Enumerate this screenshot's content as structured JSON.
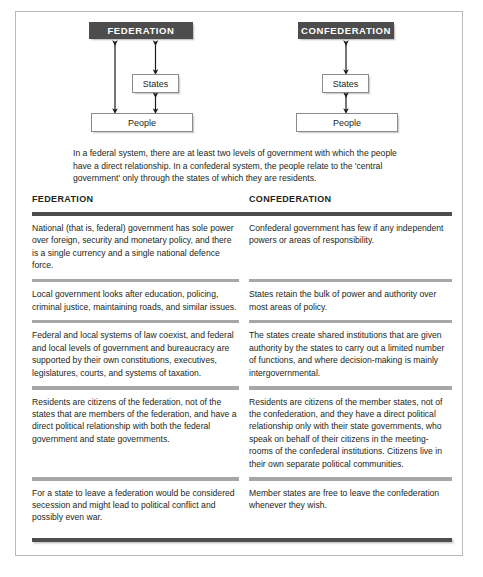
{
  "diagram": {
    "federation": {
      "title": "FEDERATION",
      "states": "States",
      "people": "People"
    },
    "confederation": {
      "title": "CONFEDERATION",
      "states": "States",
      "people": "People"
    },
    "caption": "In a federal system, there are at least two levels of government with which the people have a direct relationship. In a confederal system, the people relate to the 'central government' only through the states of which they are residents."
  },
  "table": {
    "headers": {
      "left": "FEDERATION",
      "right": "CONFEDERATION"
    },
    "rows": [
      {
        "left": "National (that is, federal) government has sole power over foreign, security and monetary policy, and there is a single currency and a single national defence force.",
        "right": "Confederal government has few if any independent powers or areas of responsibility."
      },
      {
        "left": "Local government looks after education, policing, criminal justice, maintaining roads, and similar issues.",
        "right": "States retain the bulk of power and authority over most areas of policy."
      },
      {
        "left": "Federal and local systems of law coexist, and federal and local levels of government and bureaucracy are supported by their own constitutions, executives, legislatures, courts, and systems of taxation.",
        "right": "The states create shared institutions that are given authority by the states to carry out a limited number of functions, and where decision-making is mainly intergovernmental."
      },
      {
        "left": "Residents are citizens of the federation, not of the states that are members of the federation, and have a direct political relationship with both the federal government and state governments.",
        "right": "Residents are citizens of the member states, not of the confederation, and they have a direct political relationship only with their state governments, who speak on behalf of their citizens in the meeting-rooms of the confederal institutions. Citizens live in their own separate political communities."
      },
      {
        "left": "For a state to leave a federation would be considered secession and might lead to political conflict and possibly even war.",
        "right": "Member states are free to leave the confederation whenever they wish."
      }
    ]
  },
  "colors": {
    "dark": "#4d4d4d",
    "rule": "#a7a7a7",
    "text": "#231f20",
    "frame": "#b9b9b9"
  }
}
